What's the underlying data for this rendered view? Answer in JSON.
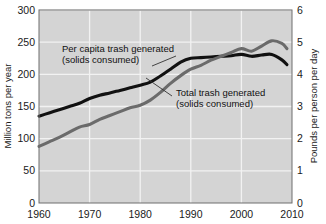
{
  "chart_data": {
    "type": "line",
    "title": "",
    "xlabel": "",
    "ylabel": "Million tons per year",
    "y2label": "Pounds per person per day",
    "xlim": [
      1960,
      2010
    ],
    "ylim": [
      0,
      300
    ],
    "y2lim": [
      0,
      6
    ],
    "grid": true,
    "legend_position": "inline-annotations",
    "x_ticks": [
      "1960",
      "1970",
      "1980",
      "1990",
      "2000",
      "2010"
    ],
    "x_tick_values": [
      1960,
      1970,
      1980,
      1990,
      2000,
      2010
    ],
    "y_ticks": [
      "0",
      "50",
      "100",
      "150",
      "200",
      "250",
      "300"
    ],
    "y_tick_values": [
      0,
      50,
      100,
      150,
      200,
      250,
      300
    ],
    "y2_ticks": [
      "0",
      "1",
      "2",
      "3",
      "4",
      "5",
      "6"
    ],
    "y2_tick_values": [
      0,
      1,
      2,
      3,
      4,
      5,
      6
    ],
    "series": [
      {
        "name": "Per capita trash generated (solids consumed)",
        "axis": "right",
        "units": "Pounds per person per day",
        "color": "#111111",
        "line_width": 3.1,
        "x": [
          1960,
          1962,
          1964,
          1966,
          1968,
          1970,
          1972,
          1974,
          1976,
          1978,
          1980,
          1982,
          1984,
          1986,
          1988,
          1990,
          1992,
          1994,
          1996,
          1998,
          2000,
          2002,
          2004,
          2006,
          2008,
          2009
        ],
        "values": [
          2.7,
          2.8,
          2.9,
          3.0,
          3.1,
          3.25,
          3.35,
          3.42,
          3.5,
          3.58,
          3.66,
          3.76,
          3.95,
          4.16,
          4.38,
          4.5,
          4.52,
          4.54,
          4.56,
          4.58,
          4.62,
          4.56,
          4.6,
          4.62,
          4.45,
          4.3
        ]
      },
      {
        "name": "Total trash generated (solids consumed)",
        "axis": "left",
        "units": "Million tons per year",
        "color": "#6b6b6b",
        "line_width": 3.1,
        "x": [
          1960,
          1962,
          1964,
          1966,
          1968,
          1970,
          1972,
          1974,
          1976,
          1978,
          1980,
          1982,
          1984,
          1986,
          1988,
          1990,
          1992,
          1994,
          1996,
          1998,
          2000,
          2002,
          2004,
          2006,
          2008,
          2009
        ],
        "values": [
          88,
          95,
          102,
          110,
          118,
          122,
          130,
          136,
          142,
          148,
          152,
          160,
          172,
          186,
          198,
          208,
          214,
          222,
          228,
          234,
          240,
          236,
          244,
          252,
          248,
          240
        ]
      }
    ],
    "annotations": [
      {
        "id": "per-capita-annotation",
        "line1": "Per capita trash generated",
        "line2": "(solids consumed)",
        "text_x": 62,
        "text_y": 52,
        "leader": {
          "x1": 152,
          "y1": 66,
          "x2": 176,
          "y2": 56
        }
      },
      {
        "id": "total-trash-annotation",
        "line1": "Total trash generated",
        "line2": "(solids consumed)",
        "text_x": 176,
        "text_y": 96,
        "leader": {
          "x1": 172,
          "y1": 96,
          "x2": 146,
          "y2": 78
        }
      }
    ],
    "colors": {
      "plot_background": "#d4d4d4",
      "grid": "#f2f2f2",
      "axis": "#6e6e6e",
      "page_background": "#ffffff",
      "per_capita_series": "#111111",
      "total_trash_series": "#6b6b6b",
      "text": "#1a1a1a"
    }
  }
}
